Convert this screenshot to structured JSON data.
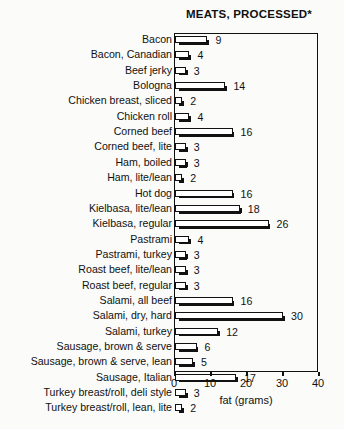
{
  "chart_data": {
    "type": "bar",
    "orientation": "horizontal",
    "title": "MEATS, PROCESSED*",
    "xlabel": "fat (grams)",
    "ylabel": "",
    "xlim": [
      0,
      40
    ],
    "xticks": [
      0,
      10,
      20,
      30,
      40
    ],
    "grid": false,
    "legend": null,
    "categories": [
      "Bacon",
      "Bacon, Canadian",
      "Beef jerky",
      "Bologna",
      "Chicken breast, sliced",
      "Chicken roll",
      "Corned beef",
      "Corned beef, lite",
      "Ham, boiled",
      "Ham, lite/lean",
      "Hot dog",
      "Kielbasa, lite/lean",
      "Kielbasa, regular",
      "Pastrami",
      "Pastrami, turkey",
      "Roast beef, lite/lean",
      "Roast beef, regular",
      "Salami, all beef",
      "Salami, dry, hard",
      "Salami, turkey",
      "Sausage, brown & serve",
      "Sausage, brown & serve, lean",
      "Sausage, Italian",
      "Turkey breast/roll, deli style",
      "Turkey breast/roll, lean, lite"
    ],
    "values": [
      9,
      4,
      3,
      14,
      2,
      4,
      16,
      3,
      3,
      2,
      16,
      18,
      26,
      4,
      3,
      3,
      3,
      16,
      30,
      12,
      6,
      5,
      17,
      3,
      2
    ],
    "value_labels": [
      "9",
      "4",
      "3",
      "14",
      "2",
      "4",
      "16",
      "3",
      "3",
      "2",
      "16",
      "18",
      "26",
      "4",
      "3",
      "3",
      "3",
      "16",
      "30",
      "12",
      "6",
      "5",
      "17",
      "3",
      "2"
    ],
    "colors": {
      "bar_fill": "#ffffff",
      "bar_outline": "#111111",
      "bar_shadow": "#111111",
      "text": "#111111",
      "background": "#fbfbfa"
    }
  }
}
